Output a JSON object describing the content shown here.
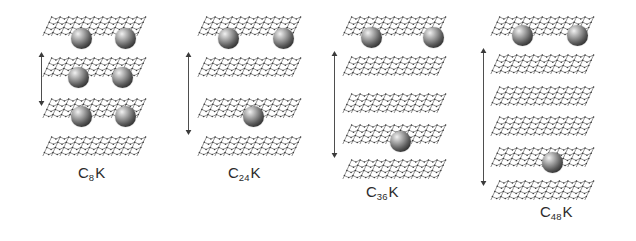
{
  "figure": {
    "background_color": "#ffffff",
    "line_color": "#3a3a3a",
    "atom_label": "potassium-atom",
    "layer_label": "graphene-layer",
    "arrow_label": "repeat-distance-arrow"
  },
  "panels": [
    {
      "id": "c8k",
      "stage": "1",
      "formula_prefix": "C",
      "formula_subscript": "8",
      "formula_suffix": "K",
      "label": "C8K",
      "label_x": 78,
      "label_y": 164,
      "left": 40,
      "sheet_width": 120,
      "layer_y": [
        14,
        55,
        96,
        134
      ],
      "atoms": [
        {
          "cx": 81,
          "cy": 38,
          "r": 10.5
        },
        {
          "cx": 125,
          "cy": 38,
          "r": 10.5
        },
        {
          "cx": 78,
          "cy": 77,
          "r": 10.5
        },
        {
          "cx": 122,
          "cy": 77,
          "r": 10.5
        },
        {
          "cx": 81,
          "cy": 116,
          "r": 10.5
        },
        {
          "cx": 125,
          "cy": 116,
          "r": 10.5
        }
      ],
      "arrow": {
        "x": 37,
        "y_top": 52,
        "y_bottom": 106
      }
    },
    {
      "id": "c24k",
      "stage": "2",
      "formula_prefix": "C",
      "formula_subscript": "24",
      "formula_suffix": "K",
      "label": "C24K",
      "label_x": 228,
      "label_y": 164,
      "left": 195,
      "sheet_width": 120,
      "layer_y": [
        14,
        55,
        96,
        134
      ],
      "atoms": [
        {
          "cx": 228,
          "cy": 38,
          "r": 10.5
        },
        {
          "cx": 283,
          "cy": 38,
          "r": 10.5
        },
        {
          "cx": 253,
          "cy": 116,
          "r": 10.5
        }
      ],
      "arrow": {
        "x": 184,
        "y_top": 52,
        "y_bottom": 135
      }
    },
    {
      "id": "c36k",
      "stage": "3",
      "formula_prefix": "C",
      "formula_subscript": "36",
      "formula_suffix": "K",
      "label": "C36K",
      "label_x": 366,
      "label_y": 183,
      "left": 340,
      "sheet_width": 120,
      "layer_y": [
        14,
        54,
        91,
        122,
        157
      ],
      "atoms": [
        {
          "cx": 371,
          "cy": 37,
          "r": 10.5
        },
        {
          "cx": 433,
          "cy": 37,
          "r": 10.5
        },
        {
          "cx": 400,
          "cy": 141,
          "r": 10.5
        }
      ],
      "arrow": {
        "x": 330,
        "y_top": 51,
        "y_bottom": 158
      }
    },
    {
      "id": "c48k",
      "stage": "4",
      "formula_prefix": "C",
      "formula_subscript": "48",
      "formula_suffix": "K",
      "label": "C48K",
      "label_x": 540,
      "label_y": 203,
      "left": 488,
      "sheet_width": 120,
      "layer_y": [
        14,
        52,
        84,
        114,
        145,
        178
      ],
      "atoms": [
        {
          "cx": 522,
          "cy": 35,
          "r": 10.5
        },
        {
          "cx": 577,
          "cy": 35,
          "r": 10.5
        },
        {
          "cx": 552,
          "cy": 162,
          "r": 10.5
        }
      ],
      "arrow": {
        "x": 479,
        "y_top": 48,
        "y_bottom": 186
      }
    }
  ]
}
